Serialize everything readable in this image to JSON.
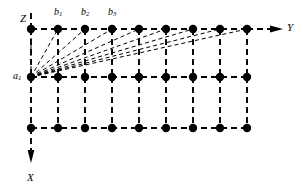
{
  "figure": {
    "type": "diagram",
    "background_color": "#ffffff",
    "ink_color": "#000000"
  },
  "axes": [
    {
      "id": "z",
      "label": "Z",
      "label_x": 20,
      "label_y": 13,
      "direction": "up"
    },
    {
      "id": "y",
      "label": "Y",
      "label_x": 287,
      "label_y": 22,
      "direction": "right"
    },
    {
      "id": "x",
      "label": "X",
      "label_x": 27,
      "label_y": 172,
      "direction": "down"
    }
  ],
  "node_labels": [
    {
      "id": "b1",
      "label": "b",
      "sub": "1",
      "x": 54,
      "y": 7
    },
    {
      "id": "b2",
      "label": "b",
      "sub": "2",
      "x": 81,
      "y": 7
    },
    {
      "id": "b3",
      "label": "b",
      "sub": "3",
      "x": 108,
      "y": 7
    },
    {
      "id": "a1",
      "label": "a",
      "sub": "1",
      "x": 13,
      "y": 71
    }
  ],
  "grid": {
    "columns": 9,
    "rows": 3,
    "x_start": 31,
    "x_step": 27,
    "row_y": [
      29,
      77,
      128
    ],
    "node_radius": 4.2,
    "line_style": "dashed",
    "dash_pattern": "6,4",
    "stroke_width": 1.9
  },
  "fan": {
    "source_node": {
      "col": 0,
      "row": 1,
      "x": 31,
      "y": 77
    },
    "target_row": 0,
    "target_columns": [
      0,
      1,
      2,
      3,
      4,
      5,
      6,
      7,
      8
    ],
    "dash_pattern": "4,3",
    "stroke_width": 1.0,
    "note": "dashed rays from a1 to every node of the top row"
  },
  "axis_lines": {
    "z_segment": {
      "x": 31,
      "y1": 29,
      "y2": 12
    },
    "y_segment": {
      "y": 29,
      "x1": 247,
      "x2": 283,
      "arrow": true
    },
    "x_segment": {
      "x": 31,
      "y1": 128,
      "y2": 163,
      "arrow": true
    }
  }
}
